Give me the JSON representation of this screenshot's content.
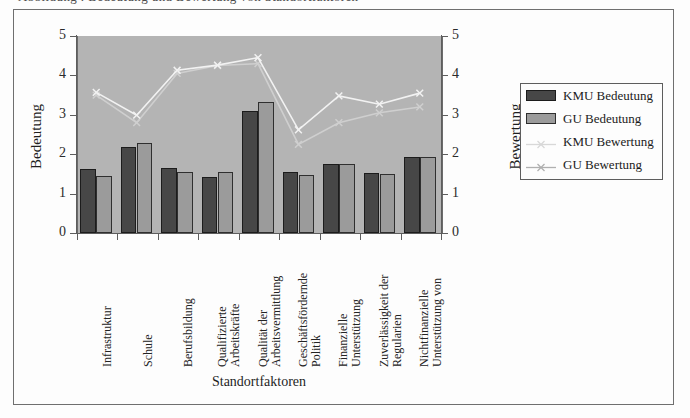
{
  "top_cut_text": "Abbildung . Bedeutung und Bewertung von Standortfaktoren",
  "chart_data": {
    "type": "bar",
    "title": "",
    "xlabel": "Standortfaktoren",
    "ylabel": "Bedeutung",
    "ylabel_right": "Bewertung",
    "ylim": [
      0,
      5
    ],
    "ylim_right": [
      0,
      5
    ],
    "yticks": [
      "0",
      "1",
      "2",
      "3",
      "4",
      "5"
    ],
    "yticks_right": [
      "0",
      "1",
      "2",
      "3",
      "4",
      "5"
    ],
    "grid": false,
    "legend_position": "right",
    "categories": [
      "Infrastruktur",
      "Schule",
      "Berufsbildung",
      "Qualifizierte Arbeitskräfte",
      "Qualität der Arbeitsvermittlung",
      "Geschäftsfördernde Politik",
      "Finanzielle Unterstützung",
      "Zuverlässigkeit der Regularien",
      "Nichtfinanzielle Unterstützung von"
    ],
    "category_label_lines": [
      [
        "Infrastruktur"
      ],
      [
        "Schule"
      ],
      [
        "Berufsbildung"
      ],
      [
        "Qualifizierte",
        "Arbeitskräfte"
      ],
      [
        "Qualität der",
        "Arbeitsvermittlung"
      ],
      [
        "Geschäftsfördernde",
        "Politik"
      ],
      [
        "Finanzielle",
        "Unterstützung"
      ],
      [
        "Zuverlässigkeit der",
        "Regularien"
      ],
      [
        "Nichtfinanzielle",
        "Unterstützung von"
      ]
    ],
    "series": [
      {
        "name": "KMU Bedeutung",
        "kind": "bar",
        "axis": "left",
        "color": "#474747",
        "values": [
          1.62,
          2.19,
          1.66,
          1.43,
          3.1,
          1.54,
          1.75,
          1.52,
          1.93
        ]
      },
      {
        "name": "GU Bedeutung",
        "kind": "bar",
        "axis": "left",
        "color": "#9b9b9b",
        "values": [
          1.45,
          2.29,
          1.54,
          1.56,
          3.33,
          1.47,
          1.75,
          1.49,
          1.93
        ]
      },
      {
        "name": "KMU Bewertung",
        "kind": "line",
        "axis": "right",
        "color": "#cfcfcf",
        "marker": "x",
        "values": [
          3.5,
          2.8,
          4.05,
          4.25,
          4.3,
          2.25,
          2.8,
          3.05,
          3.2
        ]
      },
      {
        "name": "GU Bewertung",
        "kind": "line",
        "axis": "right",
        "color": "#f2f2f2",
        "marker": "x",
        "values": [
          3.57,
          2.99,
          4.13,
          4.26,
          4.45,
          2.62,
          3.48,
          3.27,
          3.55
        ]
      }
    ]
  },
  "legend": {
    "items": [
      {
        "label": "KMU Bedeutung",
        "type": "swatch",
        "swatch_class": "kmu"
      },
      {
        "label": "GU Bedeutung",
        "type": "swatch",
        "swatch_class": "gu"
      },
      {
        "label": "KMU Bewertung",
        "type": "line",
        "color": "#d8d8d8"
      },
      {
        "label": "GU Bewertung",
        "type": "line",
        "color": "#b0b0b0"
      }
    ]
  },
  "colors": {
    "plot_background": "#b4b4b4",
    "page_background": "#fdfdfd",
    "axis": "#5d5d5d",
    "frame": "#6f6f6f",
    "bar_kmu": "#474747",
    "bar_gu": "#9b9b9b",
    "line_kmu": "#cfcfcf",
    "line_gu": "#f2f2f2"
  }
}
